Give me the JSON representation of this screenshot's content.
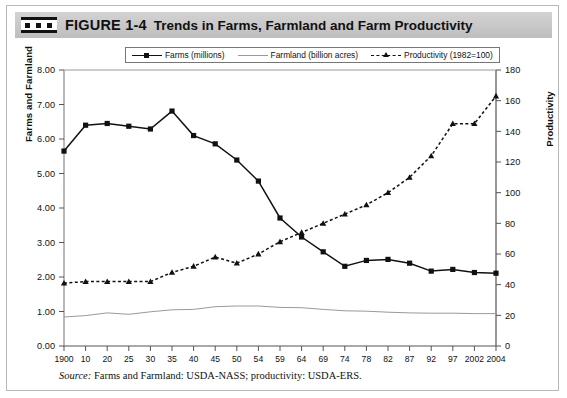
{
  "header": {
    "icon": "film-strip-icon",
    "figure_number": "FIGURE 1-4",
    "title": "Trends in Farms, Farmland and Farm Productivity",
    "band_color": "#c8c8c8"
  },
  "source_note": {
    "label": "Source:",
    "text": " Farms and Farmland: USDA-NASS; productivity: USDA-ERS."
  },
  "chart_data": {
    "type": "line",
    "title": "Trends in Farms, Farmland and Farm Productivity",
    "xlabel": "",
    "ylabel": "Farms and Farmland",
    "ylabel_right": "Productivity",
    "ylim": [
      0,
      8
    ],
    "ylim_right": [
      0,
      180
    ],
    "yticks": [
      "0.00",
      "1.00",
      "2.00",
      "3.00",
      "4.00",
      "5.00",
      "6.00",
      "7.00",
      "8.00"
    ],
    "yticks_right": [
      "0",
      "20",
      "40",
      "60",
      "80",
      "100",
      "120",
      "140",
      "160",
      "180"
    ],
    "grid": false,
    "legend_position": "top-center",
    "categories": [
      "1900",
      "10",
      "20",
      "25",
      "30",
      "35",
      "40",
      "45",
      "50",
      "54",
      "59",
      "64",
      "69",
      "74",
      "78",
      "82",
      "87",
      "92",
      "97",
      "2002",
      "2004"
    ],
    "series": [
      {
        "name": "Farms (millions)",
        "axis": "left",
        "marker": "square",
        "linestyle": "solid",
        "color": "#111111",
        "values": [
          5.65,
          6.4,
          6.45,
          6.37,
          6.29,
          6.81,
          6.1,
          5.86,
          5.39,
          4.78,
          3.71,
          3.16,
          2.73,
          2.31,
          2.48,
          2.51,
          2.4,
          2.17,
          2.22,
          2.13,
          2.11
        ]
      },
      {
        "name": "Farmland (billion acres)",
        "axis": "left",
        "marker": "none",
        "linestyle": "solid",
        "color": "#9a9a9a",
        "values": [
          0.84,
          0.88,
          0.96,
          0.92,
          0.99,
          1.05,
          1.06,
          1.14,
          1.16,
          1.16,
          1.12,
          1.11,
          1.06,
          1.02,
          1.01,
          0.98,
          0.96,
          0.95,
          0.95,
          0.94,
          0.94
        ]
      },
      {
        "name": "Productivity (1982=100)",
        "axis": "right",
        "marker": "triangle",
        "linestyle": "dashed",
        "color": "#111111",
        "values": [
          41,
          42,
          42,
          42,
          42,
          48,
          52,
          58,
          54,
          60,
          68,
          74,
          80,
          86,
          92,
          100,
          110,
          124,
          145,
          145,
          163
        ]
      }
    ]
  }
}
